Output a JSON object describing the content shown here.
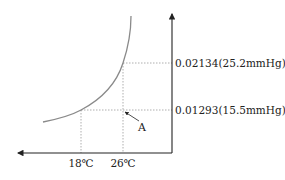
{
  "diagram": {
    "type": "saturation-humidity-curve",
    "y_axis_labels": [
      {
        "text": "0.02134(25.2mmHg)",
        "value": 0.02134,
        "pressure_mmHg": 25.2
      },
      {
        "text": "0.01293(15.5mmHg)",
        "value": 0.01293,
        "pressure_mmHg": 15.5
      }
    ],
    "x_axis_labels": [
      {
        "text": "18℃",
        "value": 18
      },
      {
        "text": "26℃",
        "value": 26
      }
    ],
    "point_label": "A",
    "colors": {
      "axis": "#222222",
      "curve": "#8a8a8a",
      "guide": "#9a9a9a",
      "text": "#222222"
    }
  }
}
